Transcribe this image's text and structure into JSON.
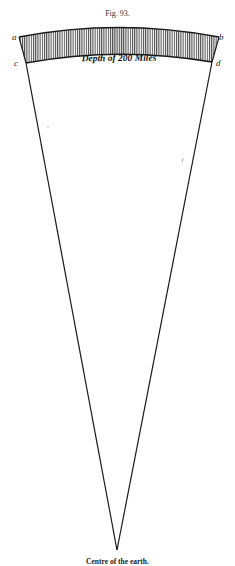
{
  "figure": {
    "title": "Fig. 93.",
    "caption": "Centre of the earth.",
    "band_label": "Depth of 200 Miles",
    "corner_labels": {
      "top_left": "a",
      "top_right": "b",
      "bottom_left": "c",
      "bottom_right": "d"
    },
    "colors": {
      "ink": "#1a1a1a",
      "hatch": "#555555",
      "paper": "#ffffff"
    }
  }
}
